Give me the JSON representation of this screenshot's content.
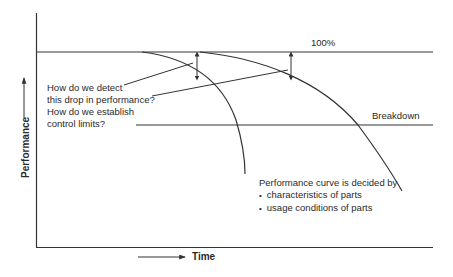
{
  "diagram": {
    "y_axis_label": "Performance",
    "x_axis_label": "Time",
    "reference_lines": {
      "top": "100%",
      "threshold": "Breakdown"
    },
    "questions": [
      {
        "line1": "How do we detect",
        "line2": "this drop in performance?"
      },
      {
        "line1": "How do we establish",
        "line2": "control limits?"
      }
    ],
    "note": {
      "heading": "Performance curve is decided by",
      "bullets": [
        "characteristics of parts",
        "usage conditions of parts"
      ]
    },
    "colors": {
      "line": "#333333",
      "background": "#ffffff"
    }
  }
}
